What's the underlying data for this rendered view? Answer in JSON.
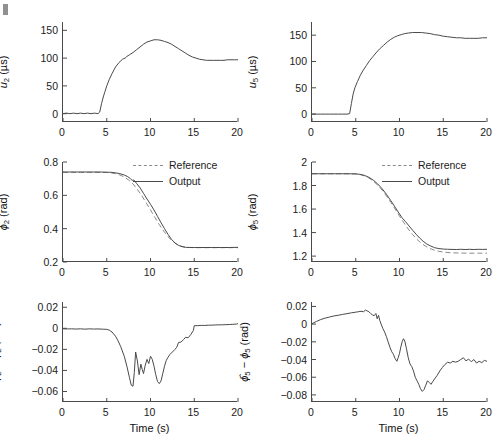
{
  "figure": {
    "background": "#ffffff",
    "line_color": "#4a4a4a",
    "reference_color": "#8a8a8a",
    "corner_mark": "crop-artifact-mark"
  },
  "legend": {
    "reference_label": "Reference",
    "output_label": "Output"
  },
  "axis": {
    "xlabel": "Time (s)",
    "xticks": [
      "0",
      "5",
      "10",
      "15",
      "20"
    ]
  },
  "chart_data": [
    {
      "id": "u2",
      "type": "line",
      "title": "",
      "ylabel": "u_2 (µs)",
      "ylabel_parts": {
        "var": "u",
        "sub": "2",
        "unit": " (µs)"
      },
      "xlabel": "",
      "xlim": [
        0,
        20
      ],
      "ylim": [
        -15,
        165
      ],
      "xticks": [
        0,
        5,
        10,
        15,
        20
      ],
      "yticks": [
        0,
        50,
        100,
        150
      ],
      "ytick_labels": [
        "0",
        "50",
        "100",
        "150"
      ],
      "grid": false,
      "legend": false,
      "series": [
        {
          "name": "u2",
          "style": "solid",
          "x": [
            0,
            0.4,
            0.8,
            1.2,
            1.6,
            2,
            2.4,
            2.8,
            3.2,
            3.6,
            4,
            4.2,
            4.4,
            4.6,
            4.8,
            5,
            5.3,
            5.6,
            6,
            6.4,
            6.8,
            7.1,
            7.3,
            7.6,
            8,
            8.4,
            8.8,
            9.2,
            9.6,
            10,
            10.4,
            10.8,
            11.2,
            11.6,
            12,
            12.4,
            12.8,
            13.2,
            13.6,
            14,
            14.4,
            14.8,
            15.2,
            15.6,
            16,
            16.4,
            16.8,
            17.2,
            17.6,
            18,
            18.4,
            18.8,
            19.2,
            19.6,
            20
          ],
          "y": [
            0,
            1,
            0,
            1,
            0,
            1,
            0,
            1,
            0,
            1,
            0,
            3,
            18,
            30,
            40,
            50,
            62,
            72,
            84,
            92,
            98,
            100,
            103,
            106,
            110,
            115,
            120,
            125,
            129,
            131,
            133,
            133,
            132,
            130,
            128,
            125,
            121,
            117,
            113,
            109,
            105,
            102,
            100,
            98,
            97,
            96,
            96,
            96,
            96,
            96,
            96,
            97,
            97,
            97,
            97
          ]
        }
      ]
    },
    {
      "id": "u5",
      "type": "line",
      "title": "",
      "ylabel": "u_5 (µs)",
      "ylabel_parts": {
        "var": "u",
        "sub": "5",
        "unit": " (µs)"
      },
      "xlabel": "",
      "xlim": [
        0,
        20
      ],
      "ylim": [
        -15,
        175
      ],
      "xticks": [
        0,
        5,
        10,
        15,
        20
      ],
      "yticks": [
        0,
        50,
        100,
        150
      ],
      "ytick_labels": [
        "0",
        "50",
        "100",
        "150"
      ],
      "grid": false,
      "legend": false,
      "series": [
        {
          "name": "u5",
          "style": "solid",
          "x": [
            0,
            0.5,
            1,
            1.5,
            2,
            2.5,
            3,
            3.5,
            4,
            4.3,
            4.5,
            4.7,
            4.9,
            5.2,
            5.5,
            5.8,
            6.2,
            6.6,
            7,
            7.4,
            7.8,
            8.2,
            8.6,
            9,
            9.4,
            9.8,
            10.2,
            10.6,
            11,
            11.5,
            12,
            12.5,
            13,
            13.5,
            14,
            14.5,
            15,
            15.5,
            16,
            16.5,
            17,
            17.5,
            18,
            18.5,
            19,
            19.5,
            20
          ],
          "y": [
            0,
            0,
            0,
            0,
            0,
            0,
            0,
            0,
            0,
            1,
            20,
            38,
            50,
            62,
            73,
            82,
            92,
            102,
            110,
            118,
            125,
            131,
            137,
            142,
            146,
            149,
            151,
            153,
            154,
            155,
            155,
            155,
            154,
            153,
            151,
            150,
            148,
            147,
            146,
            145,
            145,
            144,
            144,
            144,
            144,
            145,
            145
          ]
        }
      ]
    },
    {
      "id": "phi2",
      "type": "line",
      "title": "",
      "ylabel": "ϕ_2 (rad)",
      "ylabel_parts": {
        "var": "ϕ",
        "sub": "2",
        "unit": " (rad)"
      },
      "xlabel": "",
      "xlim": [
        0,
        20
      ],
      "ylim": [
        0.2,
        0.8
      ],
      "xticks": [
        0,
        5,
        10,
        15,
        20
      ],
      "yticks": [
        0.2,
        0.4,
        0.6,
        0.8
      ],
      "ytick_labels": [
        "0.2",
        "0.4",
        "0.6",
        "0.8"
      ],
      "grid": false,
      "legend": true,
      "legend_position": "top-right",
      "series": [
        {
          "name": "Reference",
          "style": "dashed",
          "x": [
            0,
            1,
            2,
            3,
            4,
            5,
            5.5,
            6,
            6.5,
            7,
            7.5,
            8,
            8.5,
            9,
            9.5,
            10,
            10.5,
            11,
            11.5,
            12,
            12.5,
            13,
            13.5,
            14,
            14.5,
            15,
            16,
            17,
            18,
            19,
            20
          ],
          "y": [
            0.738,
            0.738,
            0.738,
            0.738,
            0.738,
            0.737,
            0.735,
            0.73,
            0.722,
            0.71,
            0.692,
            0.668,
            0.636,
            0.598,
            0.556,
            0.512,
            0.468,
            0.424,
            0.386,
            0.352,
            0.326,
            0.306,
            0.295,
            0.289,
            0.287,
            0.286,
            0.286,
            0.286,
            0.286,
            0.286,
            0.286
          ]
        },
        {
          "name": "Output",
          "style": "solid",
          "x": [
            0,
            1,
            2,
            3,
            4,
            5,
            5.5,
            6,
            6.5,
            7,
            7.4,
            7.7,
            7.9,
            8.1,
            8.4,
            8.8,
            9.2,
            9.6,
            10,
            10.4,
            10.8,
            11.2,
            11.6,
            12,
            12.4,
            12.8,
            13.2,
            13.6,
            14,
            14.5,
            15,
            16,
            17,
            18,
            19,
            20
          ],
          "y": [
            0.74,
            0.74,
            0.74,
            0.74,
            0.74,
            0.739,
            0.738,
            0.735,
            0.73,
            0.722,
            0.712,
            0.7,
            0.69,
            0.692,
            0.672,
            0.645,
            0.612,
            0.578,
            0.546,
            0.512,
            0.474,
            0.436,
            0.4,
            0.366,
            0.336,
            0.314,
            0.3,
            0.292,
            0.288,
            0.287,
            0.287,
            0.287,
            0.287,
            0.287,
            0.287,
            0.288
          ]
        }
      ]
    },
    {
      "id": "phi5",
      "type": "line",
      "title": "",
      "ylabel": "ϕ_5 (rad)",
      "ylabel_parts": {
        "var": "ϕ",
        "sub": "5",
        "unit": " (rad)"
      },
      "xlabel": "",
      "xlim": [
        0,
        20
      ],
      "ylim": [
        1.15,
        2.0
      ],
      "xticks": [
        0,
        5,
        10,
        15,
        20
      ],
      "yticks": [
        1.2,
        1.4,
        1.6,
        1.8,
        2
      ],
      "ytick_labels": [
        "1.2",
        "1.4",
        "1.6",
        "1.8",
        "2"
      ],
      "grid": false,
      "legend": true,
      "legend_position": "top-right",
      "series": [
        {
          "name": "Reference",
          "style": "dashed",
          "x": [
            0,
            1,
            2,
            3,
            4,
            5,
            5.5,
            6,
            6.5,
            7,
            7.5,
            8,
            8.5,
            9,
            9.5,
            10,
            10.5,
            11,
            11.5,
            12,
            12.5,
            13,
            13.5,
            14,
            14.5,
            15,
            16,
            17,
            18,
            19,
            20
          ],
          "y": [
            1.9,
            1.9,
            1.9,
            1.9,
            1.9,
            1.898,
            1.893,
            1.882,
            1.864,
            1.838,
            1.804,
            1.762,
            1.712,
            1.658,
            1.6,
            1.54,
            1.483,
            1.43,
            1.383,
            1.342,
            1.308,
            1.283,
            1.264,
            1.25,
            1.241,
            1.234,
            1.228,
            1.226,
            1.225,
            1.225,
            1.225
          ]
        },
        {
          "name": "Output",
          "style": "solid",
          "x": [
            0,
            1,
            2,
            3,
            4,
            5,
            5.5,
            6,
            6.5,
            7,
            7.5,
            8,
            8.5,
            9,
            9.5,
            10,
            10.3,
            10.7,
            11.1,
            11.5,
            11.9,
            12.3,
            12.7,
            13.1,
            13.5,
            14,
            14.5,
            15,
            15.5,
            16,
            16.5,
            17,
            17.5,
            18,
            18.5,
            19,
            19.5,
            20
          ],
          "y": [
            1.9,
            1.9,
            1.9,
            1.9,
            1.9,
            1.899,
            1.895,
            1.886,
            1.87,
            1.846,
            1.814,
            1.774,
            1.726,
            1.672,
            1.616,
            1.558,
            1.525,
            1.492,
            1.456,
            1.42,
            1.386,
            1.354,
            1.326,
            1.304,
            1.288,
            1.272,
            1.264,
            1.26,
            1.258,
            1.257,
            1.256,
            1.258,
            1.256,
            1.258,
            1.256,
            1.258,
            1.257,
            1.258
          ]
        }
      ]
    },
    {
      "id": "phi2-error",
      "type": "line",
      "title": "",
      "ylabel": "ϕ̂_2 − ϕ_2 (rad)",
      "ylabel_parts": {
        "var1": "ϕ",
        "sub1": "2",
        "minus": " − ",
        "var2": "ϕ",
        "sub2": "2",
        "unit": " (rad)"
      },
      "xlabel": "Time (s)",
      "xlim": [
        0,
        20
      ],
      "ylim": [
        -0.07,
        0.025
      ],
      "xticks": [
        0,
        5,
        10,
        15,
        20
      ],
      "yticks": [
        0.02,
        0,
        -0.02,
        -0.04,
        -0.06
      ],
      "ytick_labels": [
        "0.02",
        "0",
        "−0.02",
        "−0.04",
        "−0.06"
      ],
      "grid": false,
      "legend": false,
      "series": [
        {
          "name": "phi2 error",
          "style": "solid",
          "x": [
            0,
            0.5,
            1,
            1.5,
            2,
            2.5,
            3,
            3.5,
            4,
            4.5,
            5,
            5.3,
            5.6,
            6,
            6.3,
            6.6,
            7,
            7.3,
            7.6,
            7.8,
            8,
            8.15,
            8.3,
            8.5,
            8.7,
            8.9,
            9.05,
            9.2,
            9.4,
            9.6,
            9.8,
            10,
            10.2,
            10.4,
            10.6,
            10.8,
            11,
            11.2,
            11.4,
            11.6,
            11.8,
            12,
            12.2,
            12.5,
            12.8,
            13,
            13.2,
            13.5,
            13.8,
            14,
            14.3,
            14.6,
            14.9,
            15,
            15.4,
            15.8,
            16.2,
            16.6,
            17,
            17.4,
            17.8,
            18.2,
            18.6,
            19,
            19.4,
            19.8,
            20
          ],
          "y": [
            -0.0005,
            -0.0006,
            -0.0005,
            -0.0007,
            -0.0005,
            -0.0008,
            -0.0005,
            -0.0007,
            -0.0006,
            -0.0008,
            -0.001,
            -0.0018,
            -0.0035,
            -0.0075,
            -0.012,
            -0.0175,
            -0.0265,
            -0.036,
            -0.047,
            -0.054,
            -0.055,
            -0.042,
            -0.0225,
            -0.031,
            -0.044,
            -0.034,
            -0.039,
            -0.043,
            -0.035,
            -0.0295,
            -0.0335,
            -0.0265,
            -0.0295,
            -0.036,
            -0.044,
            -0.0505,
            -0.0525,
            -0.05,
            -0.043,
            -0.036,
            -0.0305,
            -0.0275,
            -0.025,
            -0.0225,
            -0.02,
            -0.018,
            -0.0135,
            -0.013,
            -0.0105,
            -0.0085,
            -0.009,
            -0.006,
            -0.002,
            0.0025,
            0.0025,
            0.0028,
            0.0027,
            0.003,
            0.003,
            0.0032,
            0.0033,
            0.0033,
            0.0035,
            0.0036,
            0.0038,
            0.004,
            0.0045
          ]
        }
      ]
    },
    {
      "id": "phi5-error",
      "type": "line",
      "title": "",
      "ylabel": "ϕ̂_5 − ϕ_5 (rad)",
      "ylabel_parts": {
        "var1": "ϕ",
        "sub1": "5",
        "minus": " − ",
        "var2": "ϕ",
        "sub2": "5",
        "unit": " (rad)"
      },
      "xlabel": "Time (s)",
      "xlim": [
        0,
        20
      ],
      "ylim": [
        -0.088,
        0.025
      ],
      "xticks": [
        0,
        5,
        10,
        15,
        20
      ],
      "yticks": [
        0.02,
        0,
        -0.02,
        -0.04,
        -0.06,
        -0.08
      ],
      "ytick_labels": [
        "0.02",
        "0",
        "−0.02",
        "−0.04",
        "−0.06",
        "−0.08"
      ],
      "grid": false,
      "legend": false,
      "series": [
        {
          "name": "phi5 error",
          "style": "solid",
          "x": [
            0,
            0.5,
            1,
            1.5,
            2,
            2.5,
            3,
            3.5,
            4,
            4.5,
            5,
            5.3,
            5.6,
            5.9,
            6.1,
            6.3,
            6.5,
            6.7,
            6.9,
            7.1,
            7.3,
            7.45,
            7.6,
            7.75,
            7.9,
            8.1,
            8.3,
            8.5,
            8.7,
            8.9,
            9.1,
            9.3,
            9.5,
            9.7,
            9.85,
            10,
            10.15,
            10.3,
            10.45,
            10.6,
            10.8,
            11,
            11.2,
            11.4,
            11.6,
            11.8,
            12,
            12.2,
            12.4,
            12.6,
            12.8,
            13,
            13.2,
            13.4,
            13.6,
            13.8,
            14,
            14.3,
            14.6,
            14.9,
            15.2,
            15.5,
            15.8,
            16.1,
            16.4,
            16.7,
            17,
            17.3,
            17.6,
            17.9,
            18.2,
            18.5,
            18.8,
            19.1,
            19.4,
            19.7,
            20
          ],
          "y": [
            0.0005,
            0.003,
            0.0052,
            0.0068,
            0.008,
            0.0092,
            0.01,
            0.011,
            0.0118,
            0.0128,
            0.0135,
            0.014,
            0.0145,
            0.014,
            0.0158,
            0.015,
            0.014,
            0.012,
            0.0105,
            0.0095,
            0.012,
            0.006,
            0.01,
            0.004,
            0.0,
            -0.005,
            -0.009,
            -0.014,
            -0.02,
            -0.026,
            -0.031,
            -0.034,
            -0.039,
            -0.042,
            -0.038,
            -0.033,
            -0.026,
            -0.02,
            -0.0165,
            -0.019,
            -0.028,
            -0.038,
            -0.045,
            -0.048,
            -0.053,
            -0.06,
            -0.064,
            -0.068,
            -0.073,
            -0.076,
            -0.074,
            -0.069,
            -0.064,
            -0.066,
            -0.068,
            -0.065,
            -0.062,
            -0.058,
            -0.053,
            -0.049,
            -0.0455,
            -0.043,
            -0.044,
            -0.042,
            -0.043,
            -0.042,
            -0.04,
            -0.038,
            -0.0415,
            -0.0395,
            -0.0425,
            -0.04,
            -0.044,
            -0.042,
            -0.0435,
            -0.041,
            -0.042
          ]
        }
      ]
    }
  ]
}
